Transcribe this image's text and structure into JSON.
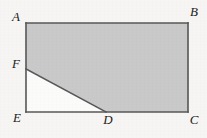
{
  "figure": {
    "kind": "geometry-diagram",
    "canvas": {
      "width": 207,
      "height": 138
    },
    "colors": {
      "background": "#f6f5f3",
      "shaded_fill": "#c9c9c9",
      "unshaded_fill": "#fbfbfa",
      "stroke": "#575757",
      "label_text": "#1b1b1b"
    },
    "stroke_width": 1.6,
    "points": {
      "A": {
        "x": 26,
        "y": 23
      },
      "B": {
        "x": 188,
        "y": 23
      },
      "C": {
        "x": 188,
        "y": 112
      },
      "D": {
        "x": 106,
        "y": 112
      },
      "E": {
        "x": 26,
        "y": 112
      },
      "F": {
        "x": 26,
        "y": 69
      }
    },
    "shaded_polygon": "26,23 188,23 188,112 106,112 26,69",
    "unshaded_polygon": "26,69 106,112 26,112",
    "rectangle_outline": "26,23 188,23 188,112 26,112",
    "segments": [
      {
        "name": "AB",
        "from": "A",
        "to": "B"
      },
      {
        "name": "BC",
        "from": "B",
        "to": "C"
      },
      {
        "name": "CE",
        "from": "C",
        "to": "E"
      },
      {
        "name": "EA",
        "from": "E",
        "to": "A"
      },
      {
        "name": "FD",
        "from": "F",
        "to": "D"
      }
    ],
    "labels": [
      {
        "id": "A",
        "text": "A",
        "x": 16,
        "y": 18
      },
      {
        "id": "B",
        "text": "B",
        "x": 194,
        "y": 13
      },
      {
        "id": "F",
        "text": "F",
        "x": 16,
        "y": 65
      },
      {
        "id": "E",
        "text": "E",
        "x": 17,
        "y": 119
      },
      {
        "id": "D",
        "text": "D",
        "x": 108,
        "y": 121
      },
      {
        "id": "C",
        "text": "C",
        "x": 194,
        "y": 121
      }
    ]
  }
}
